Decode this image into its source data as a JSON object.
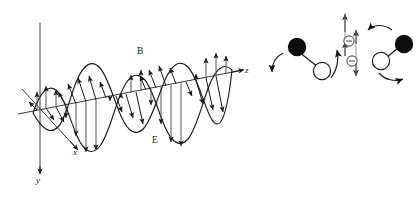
{
  "figure": {
    "type": "electromagnetic-wave-diagram",
    "background_color": "#ffffff",
    "stroke_color": "#1b1b1b",
    "width": 418,
    "height": 200
  },
  "axes": {
    "x": {
      "label": "x",
      "description": "diagonal axis toward lower-right",
      "x": 73,
      "y": 151
    },
    "y": {
      "label": "y",
      "description": "vertical axis pointing down",
      "x": 36,
      "y": 178
    },
    "z": {
      "label": "z",
      "description": "horizontal propagation axis to the right",
      "x": 245,
      "y": 70
    }
  },
  "fields": {
    "magnetic": {
      "label": "B",
      "x": 137,
      "y": 50,
      "orientation": "oblique-in-xz-plane"
    },
    "electric": {
      "label": "E",
      "x": 152,
      "y": 139,
      "orientation": "vertical-in-yz-plane"
    }
  },
  "wave": {
    "cycles": 3.5,
    "amplitude": 42,
    "start_x": 33,
    "end_x": 236,
    "baseline_y_start": 110,
    "baseline_y_end": 73,
    "arrow_count_per_curve": 16
  },
  "dipole_diagrams": [
    {
      "name": "rotating-dipole-left",
      "filled_circle": {
        "cx": 298,
        "cy": 47,
        "r": 9
      },
      "open_circle": {
        "cx": 321,
        "cy": 71,
        "r": 8.5
      },
      "arrows": [
        "curved-arrow-down-left",
        "curved-arrow-up-right"
      ]
    },
    {
      "name": "oscillating-charges-center",
      "charges": [
        {
          "symbol": "⊖",
          "cx": 350,
          "cy": 44
        },
        {
          "symbol": "⊖",
          "cx": 350,
          "cy": 62
        }
      ],
      "arrows": [
        "double-arrow-up",
        "double-arrow-down"
      ]
    },
    {
      "name": "rotating-dipole-right",
      "filled_circle": {
        "cx": 403,
        "cy": 45
      },
      "open_circle": {
        "cx": 382,
        "cy": 61
      },
      "arrows": [
        "curved-arrow-up-left",
        "curved-arrow-down-right"
      ]
    }
  ]
}
